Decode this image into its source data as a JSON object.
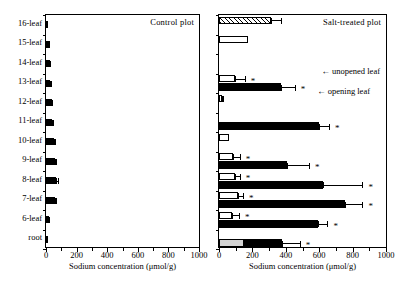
{
  "chart_data": {
    "type": "bar",
    "title": "",
    "orientation": "horizontal",
    "xlabel": "Sodium concentration (μmol/g)",
    "ylabel": "",
    "xlim": [
      0,
      1000
    ],
    "xticks": [
      0,
      200,
      400,
      600,
      800,
      1000
    ],
    "xtick_labels": [
      "0",
      "200",
      "400",
      "600",
      "800",
      "1000"
    ],
    "grid": false,
    "categories": [
      "16-leaf",
      "15-leaf",
      "14-leaf",
      "13-leaf",
      "12-leaf",
      "11-leaf",
      "10-leaf",
      "9-leaf",
      "8-leaf",
      "7-leaf",
      "6-leaf",
      "root"
    ],
    "panels": [
      {
        "name": "control",
        "title": "Control plot",
        "series": [
          {
            "name": "Control plot sodium concentration",
            "style": "black",
            "values": [
              6,
              28,
              26,
              28,
              38,
              42,
              52,
              58,
              68,
              56,
              20,
              10
            ],
            "errors": [
              0,
              0,
              9,
              10,
              10,
              9,
              12,
              14,
              16,
              14,
              8,
              0
            ],
            "significant": [
              false,
              false,
              false,
              false,
              false,
              false,
              false,
              false,
              false,
              false,
              false,
              false
            ]
          }
        ]
      },
      {
        "name": "salt_treated",
        "title": "Salt-treated plot",
        "series": [
          {
            "name": "Upper bar (open leaf position)",
            "style": "white",
            "values": [
              null,
              175,
              null,
              95,
              20,
              null,
              60,
              85,
              95,
              115,
              80,
              null
            ],
            "errors": [
              null,
              0,
              null,
              65,
              10,
              null,
              0,
              45,
              35,
              35,
              45,
              null
            ],
            "significant": [
              false,
              false,
              false,
              true,
              false,
              false,
              false,
              true,
              true,
              true,
              true,
              false
            ]
          },
          {
            "name": "Lower bar (sodium concentration)",
            "style": "black",
            "values": [
              null,
              null,
              null,
              370,
              null,
              600,
              null,
              405,
              625,
              755,
              595,
              380
            ],
            "errors": [
              null,
              null,
              null,
              90,
              null,
              65,
              null,
              140,
              240,
              110,
              60,
              110
            ],
            "significant": [
              false,
              false,
              false,
              true,
              false,
              true,
              false,
              true,
              true,
              true,
              true,
              true
            ]
          },
          {
            "name": "Unopened leaf (16-leaf)",
            "style": "hatch",
            "values": [
              310,
              null,
              null,
              null,
              null,
              null,
              null,
              null,
              null,
              null,
              null,
              null
            ],
            "errors": [
              65,
              null,
              null,
              null,
              null,
              null,
              null,
              null,
              null,
              null,
              null,
              null
            ],
            "significant": [
              false,
              false,
              false,
              false,
              false,
              false,
              false,
              false,
              false,
              false,
              false,
              false
            ]
          },
          {
            "name": "Root",
            "style": "gray",
            "values": [
              null,
              null,
              null,
              null,
              null,
              null,
              null,
              null,
              null,
              null,
              null,
              150
            ],
            "errors": [
              null,
              null,
              null,
              null,
              null,
              null,
              null,
              null,
              null,
              null,
              null,
              45
            ],
            "significant": [
              false,
              false,
              false,
              false,
              false,
              false,
              false,
              false,
              false,
              false,
              false,
              true
            ]
          }
        ],
        "annotations": [
          {
            "text": "← unopened leaf",
            "target_category": "16-leaf"
          },
          {
            "text": "← opening leaf",
            "target_category": "15-leaf"
          }
        ]
      }
    ],
    "legend_position": "inside-right",
    "significance_marker": "*"
  },
  "axis": {
    "x_label": "Sodium concentration (μmol/g)",
    "x_tick_labels": [
      "0",
      "200",
      "400",
      "600",
      "800",
      "1000"
    ]
  },
  "y_categories": [
    "16-leaf",
    "15-leaf",
    "14-leaf",
    "13-leaf",
    "12-leaf",
    "11-leaf",
    "10-leaf",
    "9-leaf",
    "8-leaf",
    "7-leaf",
    "6-leaf",
    "root"
  ],
  "panel_titles": {
    "control": "Control plot",
    "salt": "Salt-treated plot"
  },
  "annotations": {
    "unopened": "← unopened leaf",
    "opening": "← opening leaf"
  },
  "colors": {
    "axis": "#000000",
    "bar_filled": "#000000",
    "bar_open": "#ffffff",
    "bar_root": "#d4d4d4",
    "background": "#ffffff"
  }
}
